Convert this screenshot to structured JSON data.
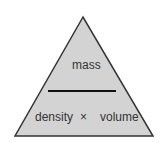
{
  "diagram": {
    "type": "formula-triangle",
    "top": "mass",
    "bottom_left": "density",
    "operator": "×",
    "bottom_right": "volume",
    "colors": {
      "fill": "#d3d3d3",
      "stroke": "#333333",
      "divider": "#111111"
    }
  }
}
